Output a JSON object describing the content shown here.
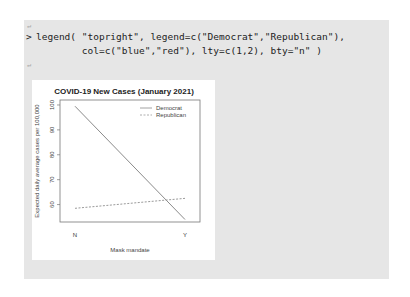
{
  "console": {
    "blank_mark_1": "↵",
    "prompt": ">",
    "code_line_1": "legend( \"topright\", legend=c(\"Democrat\",\"Republican\"),",
    "code_line_2": "        col=c(\"blue\",\"red\"), lty=c(1,2), bty=\"n\" )",
    "line_end_mark": "↵",
    "blank_mark_2": "↵"
  },
  "chart_data": {
    "type": "line",
    "title": "COVID-19 New Cases (January 2021)",
    "xlabel": "Mask mandate",
    "ylabel": "Expected daily average cases per 100,000",
    "categories": [
      "N",
      "Y"
    ],
    "yticks": [
      60,
      70,
      80,
      90,
      100
    ],
    "ylim": [
      53,
      102
    ],
    "series": [
      {
        "name": "Democrat",
        "values": [
          99.5,
          54
        ],
        "color": "#8a8a8a",
        "lty": "solid"
      },
      {
        "name": "Republican",
        "values": [
          58.5,
          62.5
        ],
        "color": "#9a9a9a",
        "lty": "dashed"
      }
    ],
    "legend": {
      "position": "topright",
      "entries": [
        "Democrat",
        "Republican"
      ],
      "box": false
    }
  }
}
